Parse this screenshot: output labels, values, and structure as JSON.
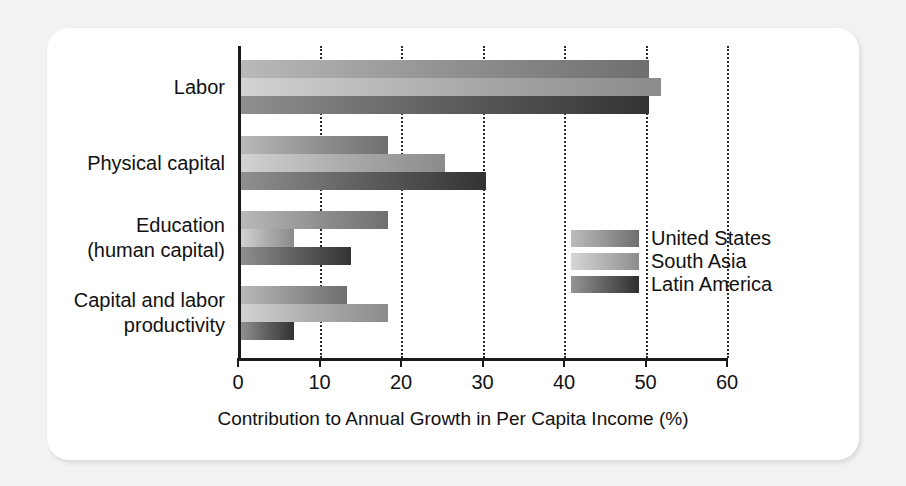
{
  "chart_data": {
    "type": "bar",
    "orientation": "horizontal",
    "title": "",
    "xlabel": "Contribution to Annual Growth in Per Capita Income (%)",
    "ylabel": "",
    "xlim": [
      0,
      60
    ],
    "xticks": [
      0,
      10,
      20,
      30,
      40,
      50,
      60
    ],
    "xtick_labels": [
      "0",
      "10",
      "20",
      "30",
      "40",
      "50",
      "60"
    ],
    "grid": "vertical dotted gridlines at each x tick",
    "legend_position": "inside plot, center-right",
    "categories": [
      "Labor",
      "Physical capital",
      "Education\n(human capital)",
      "Capital and labor\nproductivity"
    ],
    "series": [
      {
        "name": "United States",
        "color": "#8e8e8e",
        "values": [
          50,
          18,
          18,
          13
        ]
      },
      {
        "name": "South Asia",
        "color": "#ababab",
        "values": [
          51.5,
          25,
          6.5,
          18
        ]
      },
      {
        "name": "Latin America",
        "color": "#4a4a4a",
        "values": [
          50,
          30,
          13.5,
          6.5
        ]
      }
    ]
  },
  "legend": {
    "entries": [
      {
        "label": "United States"
      },
      {
        "label": "South Asia"
      },
      {
        "label": "Latin America"
      }
    ]
  },
  "axis": {
    "x_title": "Contribution to Annual Growth in Per Capita Income (%)",
    "tick_labels": [
      "0",
      "10",
      "20",
      "30",
      "40",
      "50",
      "60"
    ]
  },
  "colors": {
    "page_background": "#f2f2f2",
    "card_background": "#ffffff",
    "axis": "#1a1a1a",
    "text": "#111111",
    "series_united_states": "#8e8e8e",
    "series_south_asia": "#ababab",
    "series_latin_america": "#4a4a4a"
  }
}
